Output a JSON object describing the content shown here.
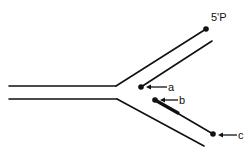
{
  "diagram": {
    "kind": "replication-fork",
    "colors": {
      "line": "#111111",
      "background": "#ffffff"
    },
    "labels": {
      "five_prime": "5'P",
      "a": "a",
      "b": "b",
      "c": "c"
    }
  }
}
